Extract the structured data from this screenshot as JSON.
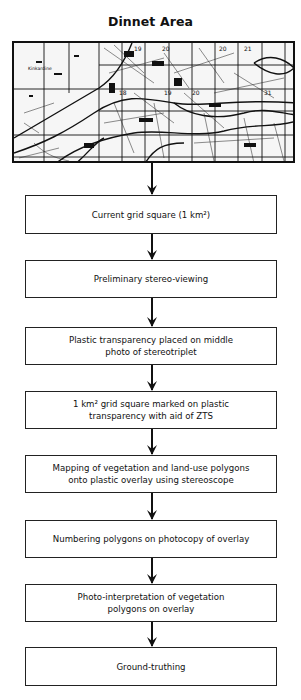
{
  "title": "Dinnet Area",
  "map": {
    "description": "Topographic map excerpt of Dinnet area with 1 km grid overlay",
    "place_label": "Kinkardine",
    "grid_numbers": [
      "19",
      "20",
      "21",
      "18",
      "19",
      "20",
      "21",
      "31"
    ]
  },
  "steps": [
    {
      "line1": "Current grid square (1 km²)"
    },
    {
      "line1": "Preliminary stereo-viewing"
    },
    {
      "line1": "Plastic transparency placed on middle",
      "line2": "photo of stereotriplet"
    },
    {
      "line1": "1 km² grid square marked on plastic",
      "line2": "transparency with aid of  ZTS"
    },
    {
      "line1": "Mapping of vegetation and land-use polygons",
      "line2": "onto plastic overlay using stereoscope"
    },
    {
      "line1": "Numbering polygons on photocopy of overlay"
    },
    {
      "line1": "Photo-interpretation of vegetation",
      "line2": "polygons on overlay"
    },
    {
      "line1": "Ground-truthing"
    }
  ],
  "colors": {
    "line": "#111111",
    "background": "#ffffff"
  }
}
